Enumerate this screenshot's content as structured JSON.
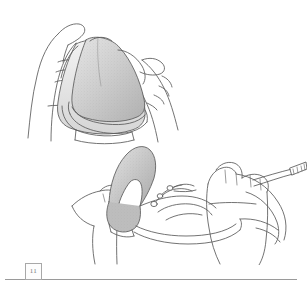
{
  "page": {
    "background_color": "#ffffff",
    "width": 307,
    "height": 293,
    "kind": "scanned-instruction-page"
  },
  "footer": {
    "page_number": "11",
    "rule_color": "#9a9a9a",
    "box_border_color": "#a8a8a8"
  },
  "illustrations": [
    {
      "id": "step-top",
      "name": "hands-holding-triangular-cushion",
      "caption": "",
      "ink_color": "#555555",
      "fill_light": "#e8e8e8",
      "fill_mid": "#c9c9c9",
      "fill_dark": "#a9a9a9",
      "description": "Two hands grasping a triangular foam shoe-insert cushion from either side"
    },
    {
      "id": "step-bottom",
      "name": "inserting-cushion-into-shoe",
      "caption": "",
      "ink_color": "#555555",
      "fill_light": "#e8e8e8",
      "fill_mid": "#c9c9c9",
      "fill_dark": "#a9a9a9",
      "description": "Hand sliding the cushion into a laced shoe held by a second hand, strap at right"
    }
  ]
}
